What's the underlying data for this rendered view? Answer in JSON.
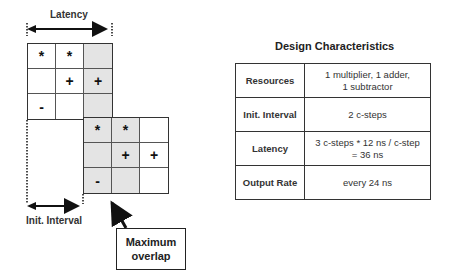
{
  "diagram": {
    "latency_label": "Latency",
    "init_interval_label": "Init. Interval",
    "callout": {
      "line1": "Maximum",
      "line2": "overlap"
    },
    "grid1": [
      [
        {
          "sym": "*",
          "shade": false
        },
        {
          "sym": "*",
          "shade": false
        },
        {
          "sym": "",
          "shade": true
        }
      ],
      [
        {
          "sym": "",
          "shade": false
        },
        {
          "sym": "+",
          "shade": false
        },
        {
          "sym": "+",
          "shade": true
        }
      ],
      [
        {
          "sym": "-",
          "shade": false
        },
        {
          "sym": "",
          "shade": false
        },
        {
          "sym": "",
          "shade": true
        }
      ]
    ],
    "grid2": [
      [
        {
          "sym": "*",
          "shade": true
        },
        {
          "sym": "*",
          "shade": true
        },
        {
          "sym": "",
          "shade": false
        }
      ],
      [
        {
          "sym": "",
          "shade": true
        },
        {
          "sym": "+",
          "shade": true
        },
        {
          "sym": "+",
          "shade": false
        }
      ],
      [
        {
          "sym": "-",
          "shade": true
        },
        {
          "sym": "",
          "shade": true
        },
        {
          "sym": "",
          "shade": false
        }
      ]
    ]
  },
  "table": {
    "title": "Design Characteristics",
    "rows": [
      {
        "label": "Resources",
        "value": "1 multiplier, 1 adder,\n1 subtractor"
      },
      {
        "label": "Init. Interval",
        "value": "2 c-steps"
      },
      {
        "label": "Latency",
        "value": "3 c-steps * 12 ns / c-step\n= 36 ns"
      },
      {
        "label": "Output Rate",
        "value": "every 24 ns"
      }
    ]
  }
}
